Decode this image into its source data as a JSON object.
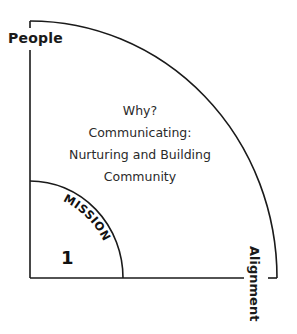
{
  "diagram": {
    "axes": {
      "vertical_label": "People",
      "horizontal_label": "Alignment"
    },
    "outer_region": {
      "lines": [
        "Why?",
        "Communicating:",
        "Nurturing and Building",
        "Community"
      ]
    },
    "inner_region": {
      "arc_label": "MISSION",
      "number": "1"
    },
    "colors": {
      "stroke": "#1a1a1a",
      "background": "#ffffff",
      "text": "#1a1a1a"
    }
  }
}
